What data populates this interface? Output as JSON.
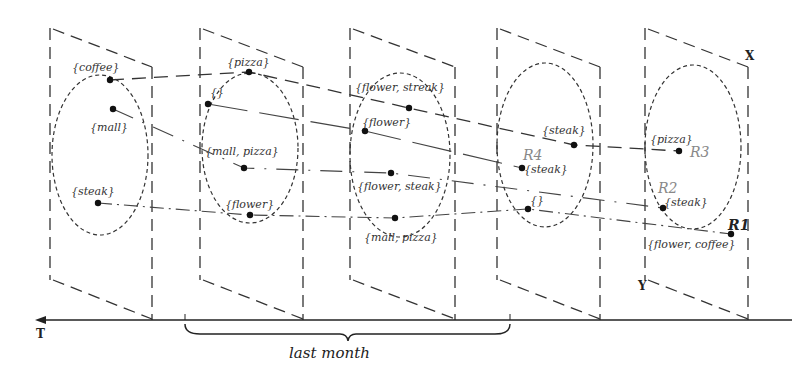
{
  "axes": {
    "t": "T",
    "x": "X",
    "y": "Y"
  },
  "caption": "last month",
  "frames": [
    {
      "points": [
        {
          "label": "{coffee}",
          "x": 110,
          "y": 80,
          "lx": 72,
          "ly": 62
        },
        {
          "label": "{mall}",
          "x": 113,
          "y": 109,
          "lx": 90,
          "ly": 122
        },
        {
          "label": "{steak}",
          "x": 98,
          "y": 203,
          "lx": 71,
          "ly": 186
        }
      ]
    },
    {
      "points": [
        {
          "label": "{pizza}",
          "x": 249,
          "y": 72,
          "lx": 227,
          "ly": 57
        },
        {
          "label": "{}",
          "x": 208,
          "y": 104,
          "lx": 210,
          "ly": 87
        },
        {
          "label": "{mall, pizza}",
          "x": 244,
          "y": 168,
          "lx": 205,
          "ly": 146
        },
        {
          "label": "{flower}",
          "x": 250,
          "y": 215,
          "lx": 225,
          "ly": 199
        }
      ]
    },
    {
      "points": [
        {
          "label": "{flower, streak}",
          "x": 409,
          "y": 108,
          "lx": 355,
          "ly": 82
        },
        {
          "label": "{flower}",
          "x": 365,
          "y": 131,
          "lx": 362,
          "ly": 117
        },
        {
          "label": "{flower, steak}",
          "x": 391,
          "y": 173,
          "lx": 357,
          "ly": 181
        },
        {
          "label": "{mall, pizza}",
          "x": 395,
          "y": 218,
          "lx": 364,
          "ly": 232
        }
      ]
    },
    {
      "points": [
        {
          "label": "{steak}",
          "x": 574,
          "y": 145,
          "lx": 542,
          "ly": 125
        },
        {
          "label": "{steak}",
          "x": 522,
          "y": 168,
          "lx": 524,
          "ly": 164
        },
        {
          "label": "{}",
          "x": 528,
          "y": 209,
          "lx": 530,
          "ly": 195
        }
      ]
    },
    {
      "points": [
        {
          "label": "{pizza}",
          "x": 679,
          "y": 151,
          "lx": 650,
          "ly": 134
        },
        {
          "label": "{steak}",
          "x": 663,
          "y": 208,
          "lx": 664,
          "ly": 197
        },
        {
          "label": "{flower, coffee}",
          "x": 731,
          "y": 234,
          "lx": 647,
          "ly": 239
        }
      ]
    }
  ],
  "region_labels": [
    {
      "label": "R1",
      "x": 728,
      "y": 218,
      "dark": true
    },
    {
      "label": "R2",
      "x": 658,
      "y": 181,
      "dark": false
    },
    {
      "label": "R3",
      "x": 690,
      "y": 145,
      "dark": false
    },
    {
      "label": "R4",
      "x": 523,
      "y": 148,
      "dark": false
    }
  ],
  "trajectories": [
    {
      "name": "coffee-pizza-flowerstreak-steak-pizza",
      "style": "dash",
      "points": [
        [
          110,
          80
        ],
        [
          249,
          72
        ],
        [
          409,
          108
        ],
        [
          574,
          145
        ],
        [
          679,
          151
        ]
      ]
    },
    {
      "name": "mall-mallpizza-flowersteak-R2",
      "style": "dashdot-sparse",
      "points": [
        [
          113,
          109
        ],
        [
          244,
          168
        ],
        [
          391,
          173
        ],
        [
          663,
          208
        ]
      ]
    },
    {
      "name": "empty-flower-R4",
      "style": "solid-gap",
      "points": [
        [
          208,
          104
        ],
        [
          365,
          131
        ],
        [
          522,
          168
        ]
      ]
    },
    {
      "name": "steak-flower-mallpizza-empty-R1",
      "style": "dashdot",
      "points": [
        [
          98,
          203
        ],
        [
          250,
          215
        ],
        [
          395,
          218
        ],
        [
          528,
          209
        ],
        [
          731,
          234
        ]
      ]
    }
  ],
  "ellipses": [
    {
      "cx": 100,
      "cy": 155,
      "rx": 48,
      "ry": 80
    },
    {
      "cx": 250,
      "cy": 148,
      "rx": 48,
      "ry": 75
    },
    {
      "cx": 400,
      "cy": 155,
      "rx": 50,
      "ry": 82
    },
    {
      "cx": 545,
      "cy": 145,
      "rx": 48,
      "ry": 82
    },
    {
      "cx": 693,
      "cy": 147,
      "rx": 48,
      "ry": 82
    }
  ],
  "panels": [
    {
      "lx": 50,
      "rx": 152
    },
    {
      "lx": 200,
      "rx": 303
    },
    {
      "lx": 350,
      "rx": 455
    },
    {
      "lx": 497,
      "rx": 600
    },
    {
      "lx": 645,
      "rx": 748
    }
  ]
}
